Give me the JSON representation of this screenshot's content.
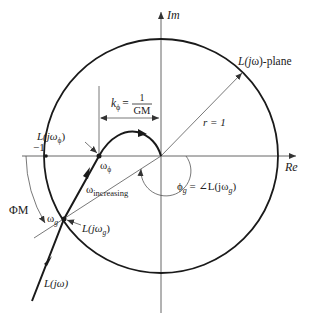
{
  "figure": {
    "axes": {
      "real_label": "Re",
      "imag_label": "Im",
      "minus_one_label": "−1"
    },
    "plane_label": {
      "prefix": "L(",
      "j": "j",
      "omega": "ω",
      "suffix": ")-plane"
    },
    "unit_circle": {
      "radius_label": "r = 1"
    },
    "gain_margin": {
      "k_label": "k",
      "k_sub": "ϕ",
      "equals": "=",
      "numerator": "1",
      "denominator": "GM"
    },
    "phase_crossover": {
      "point_label": "L(jω",
      "point_sub": "ϕ",
      "point_close": ")",
      "freq_label": "ω",
      "freq_sub": "ϕ"
    },
    "gain_crossover": {
      "point_label": "L(jω",
      "point_sub": "g",
      "point_close": ")",
      "freq_label": "ω",
      "freq_sub": "g"
    },
    "phase_margin_label": "ΦM",
    "omega_increasing": {
      "symbol": "ω",
      "sub": "increasing"
    },
    "phase_angle": {
      "phi": "ϕ",
      "phi_sub": "g",
      "equals": " = ∠L(jω",
      "sub": "g",
      "close": ")"
    },
    "nyquist_curve_label": "L(jω)"
  },
  "colors": {
    "stroke": "#1a1a1a",
    "axis": "#555555",
    "background": "#ffffff"
  }
}
